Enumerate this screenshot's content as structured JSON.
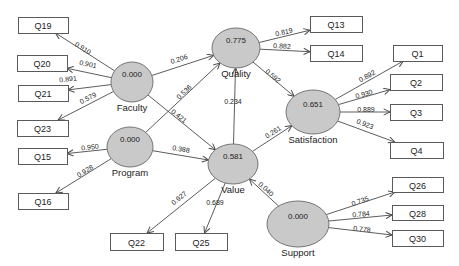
{
  "diagram": {
    "type": "sem-path-diagram",
    "canvas": {
      "width": 459,
      "height": 266,
      "background": "#ffffff"
    },
    "styles": {
      "latent_fill": "#c9c9c9",
      "latent_stroke": "#757575",
      "box_fill": "#ffffff",
      "box_stroke": "#5a5a5a",
      "edge_color": "#4a4a4a",
      "text_color": "#222222"
    },
    "latents": [
      {
        "id": "Faculty",
        "label": "Faculty",
        "value": "0.000",
        "cx": 132,
        "cy": 82,
        "rx": 21,
        "ry": 20
      },
      {
        "id": "Program",
        "label": "Program",
        "value": "0.000",
        "cx": 130,
        "cy": 147,
        "rx": 23,
        "ry": 20
      },
      {
        "id": "Quality",
        "label": "Quality",
        "value": "0.775",
        "cx": 236,
        "cy": 48,
        "rx": 24,
        "ry": 20
      },
      {
        "id": "Value",
        "label": "Value",
        "value": "0.581",
        "cx": 233,
        "cy": 164,
        "rx": 25,
        "ry": 20
      },
      {
        "id": "Satisfaction",
        "label": "Satisfaction",
        "value": "0.651",
        "cx": 313,
        "cy": 112,
        "rx": 27,
        "ry": 22
      },
      {
        "id": "Support",
        "label": "Support",
        "value": "0.000",
        "cx": 298,
        "cy": 224,
        "rx": 31,
        "ry": 23
      }
    ],
    "indicators": [
      {
        "id": "Q19",
        "label": "Q19",
        "x": 18,
        "y": 17,
        "w": 50,
        "h": 16
      },
      {
        "id": "Q20",
        "label": "Q20",
        "x": 17,
        "y": 55,
        "w": 50,
        "h": 16
      },
      {
        "id": "Q21",
        "label": "Q21",
        "x": 18,
        "y": 85,
        "w": 50,
        "h": 16
      },
      {
        "id": "Q23",
        "label": "Q23",
        "x": 17,
        "y": 120,
        "w": 51,
        "h": 16
      },
      {
        "id": "Q15",
        "label": "Q15",
        "x": 18,
        "y": 148,
        "w": 49,
        "h": 16
      },
      {
        "id": "Q16",
        "label": "Q16",
        "x": 18,
        "y": 193,
        "w": 50,
        "h": 16
      },
      {
        "id": "Q22",
        "label": "Q22",
        "x": 110,
        "y": 233,
        "w": 53,
        "h": 17
      },
      {
        "id": "Q25",
        "label": "Q25",
        "x": 175,
        "y": 233,
        "w": 52,
        "h": 17
      },
      {
        "id": "Q13",
        "label": "Q13",
        "x": 310,
        "y": 16,
        "w": 52,
        "h": 16
      },
      {
        "id": "Q14",
        "label": "Q14",
        "x": 310,
        "y": 45,
        "w": 52,
        "h": 16
      },
      {
        "id": "Q1",
        "label": "Q1",
        "x": 393,
        "y": 45,
        "w": 49,
        "h": 16
      },
      {
        "id": "Q2",
        "label": "Q2",
        "x": 390,
        "y": 74,
        "w": 52,
        "h": 16
      },
      {
        "id": "Q3",
        "label": "Q3",
        "x": 390,
        "y": 104,
        "w": 52,
        "h": 16
      },
      {
        "id": "Q4",
        "label": "Q4",
        "x": 390,
        "y": 142,
        "w": 53,
        "h": 16
      },
      {
        "id": "Q26",
        "label": "Q26",
        "x": 392,
        "y": 177,
        "w": 51,
        "h": 15
      },
      {
        "id": "Q28",
        "label": "Q28",
        "x": 392,
        "y": 205,
        "w": 51,
        "h": 15
      },
      {
        "id": "Q30",
        "label": "Q30",
        "x": 392,
        "y": 230,
        "w": 51,
        "h": 16
      }
    ],
    "paths": [
      {
        "from": "Faculty",
        "to": "Q19",
        "label": "0.910",
        "lx": 83,
        "ly": 48
      },
      {
        "from": "Faculty",
        "to": "Q20",
        "label": "0.901",
        "lx": 88,
        "ly": 64
      },
      {
        "from": "Faculty",
        "to": "Q21",
        "label": "0.891",
        "lx": 68,
        "ly": 79
      },
      {
        "from": "Faculty",
        "to": "Q23",
        "label": "0.579",
        "lx": 88,
        "ly": 98
      },
      {
        "from": "Faculty",
        "to": "Quality",
        "label": "0.206",
        "lx": 179,
        "ly": 59
      },
      {
        "from": "Faculty",
        "to": "Value",
        "label": "0.421",
        "lx": 179,
        "ly": 116
      },
      {
        "from": "Program",
        "to": "Q15",
        "label": "0.950",
        "lx": 90,
        "ly": 147
      },
      {
        "from": "Program",
        "to": "Q16",
        "label": "0.928",
        "lx": 85,
        "ly": 171
      },
      {
        "from": "Program",
        "to": "Quality",
        "label": "0.536",
        "lx": 184,
        "ly": 92
      },
      {
        "from": "Program",
        "to": "Value",
        "label": "0.388",
        "lx": 181,
        "ly": 149
      },
      {
        "from": "Quality",
        "to": "Q13",
        "label": "0.819",
        "lx": 284,
        "ly": 32
      },
      {
        "from": "Quality",
        "to": "Q14",
        "label": "0.882",
        "lx": 282,
        "ly": 46
      },
      {
        "from": "Quality",
        "to": "Satisfaction",
        "label": "0.592",
        "lx": 273,
        "ly": 76
      },
      {
        "from": "Value",
        "to": "Quality",
        "label": "0.234",
        "lx": 233,
        "ly": 101
      },
      {
        "from": "Value",
        "to": "Q22",
        "label": "0.927",
        "lx": 179,
        "ly": 198
      },
      {
        "from": "Value",
        "to": "Q25",
        "label": "0.689",
        "lx": 215,
        "ly": 202
      },
      {
        "from": "Value",
        "to": "Satisfaction",
        "label": "0.261",
        "lx": 273,
        "ly": 132
      },
      {
        "from": "Support",
        "to": "Value",
        "label": "0.040",
        "lx": 266,
        "ly": 189
      },
      {
        "from": "Satisfaction",
        "to": "Q1",
        "label": "0.892",
        "lx": 367,
        "ly": 76
      },
      {
        "from": "Satisfaction",
        "to": "Q2",
        "label": "0.930",
        "lx": 364,
        "ly": 94
      },
      {
        "from": "Satisfaction",
        "to": "Q3",
        "label": "0.889",
        "lx": 366,
        "ly": 109
      },
      {
        "from": "Satisfaction",
        "to": "Q4",
        "label": "0.923",
        "lx": 365,
        "ly": 124
      },
      {
        "from": "Support",
        "to": "Q26",
        "label": "0.735",
        "lx": 360,
        "ly": 201
      },
      {
        "from": "Support",
        "to": "Q28",
        "label": "0.784",
        "lx": 361,
        "ly": 214
      },
      {
        "from": "Support",
        "to": "Q30",
        "label": "0.778",
        "lx": 362,
        "ly": 229
      }
    ]
  }
}
